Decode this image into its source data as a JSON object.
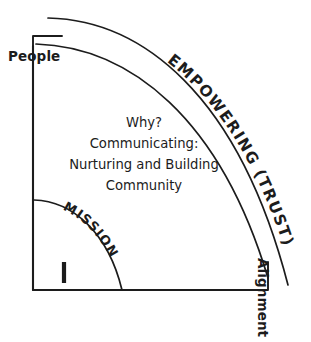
{
  "diagram": {
    "title_visible": false,
    "type": "quadrant-arc-diagram",
    "stroke_color": "#1c1c1c",
    "background_color": "#ffffff",
    "axes": {
      "vertical": {
        "label": "People",
        "orientation": "horizontal-text-top-left",
        "has_end_bracket": true
      },
      "horizontal": {
        "label": "Alignment",
        "orientation": "rotated-90-clockwise",
        "has_end_bracket": true
      }
    },
    "arcs": [
      {
        "name": "outer-arc",
        "label": "EMPOWERING (TRUST)",
        "label_on_path": true
      },
      {
        "name": "middle-arc",
        "label": "",
        "label_on_path": false
      },
      {
        "name": "inner-arc",
        "label": "MISSION",
        "label_on_path": true
      }
    ],
    "center_text": {
      "lines": [
        "Why?",
        "Communicating:",
        "Nurturing and Building",
        "Community"
      ]
    },
    "tick_mark": {
      "name": "mission-tick",
      "glyph": "|"
    }
  }
}
